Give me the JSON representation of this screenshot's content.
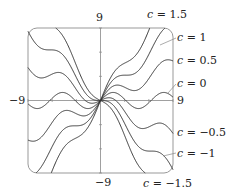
{
  "chart_data": {
    "type": "line",
    "title": "",
    "xlabel": "",
    "ylabel": "",
    "xlim": [
      -9,
      9
    ],
    "ylim": [
      -9,
      9
    ],
    "grid": false,
    "x_tick_labels": {
      "left": "−9",
      "right": "9"
    },
    "y_tick_labels": {
      "top": "9",
      "bottom": "−9"
    },
    "model": "y = c·x + sin(x)",
    "series": [
      {
        "name": "c = 1.5",
        "c": 1.5,
        "label_var": "c",
        "label_val": "= 1.5"
      },
      {
        "name": "c = 1",
        "c": 1,
        "label_var": "c",
        "label_val": "= 1"
      },
      {
        "name": "c = 0.5",
        "c": 0.5,
        "label_var": "c",
        "label_val": "= 0.5"
      },
      {
        "name": "c = 0",
        "c": 0,
        "label_var": "c",
        "label_val": "= 0"
      },
      {
        "name": "c = −0.5",
        "c": -0.5,
        "label_var": "c",
        "label_val": "= −0.5"
      },
      {
        "name": "c = −1",
        "c": -1,
        "label_var": "c",
        "label_val": "= −1"
      },
      {
        "name": "c = −1.5",
        "c": -1.5,
        "label_var": "c",
        "label_val": "= −1.5"
      }
    ],
    "colors": {
      "curve": "#333333",
      "frame": "#999999",
      "axis": "#777777"
    }
  }
}
